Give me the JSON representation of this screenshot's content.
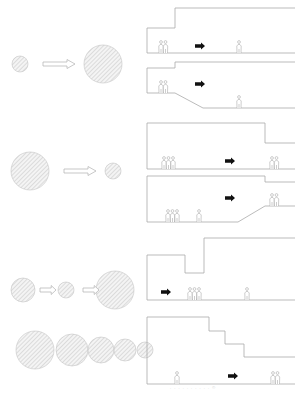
{
  "colors": {
    "line": "#aaaaaa",
    "hatch": "#bdbdbd",
    "fill": "#f2f2f2",
    "arrow": "#111111",
    "person": "#9a9a9a"
  },
  "rows": [
    {
      "id": "expansion",
      "left": {
        "circles": [
          {
            "cx": 20,
            "cy": 64,
            "r": 8
          },
          {
            "cx": 103,
            "cy": 64,
            "r": 19
          }
        ],
        "arrows": [
          {
            "x": 43,
            "y": 64,
            "w": 32
          }
        ]
      },
      "panels": [
        {
          "floor": 53,
          "shape": "M147,53 L147,28 L175,28 L175,8 L295,8",
          "floorPath": "M147,53 L295,53",
          "people": [
            {
              "x": 161,
              "n": 2
            },
            {
              "x": 239,
              "n": 1
            }
          ],
          "arrow": {
            "x": 195,
            "y": 46
          }
        },
        {
          "floor": 108,
          "shape": "M147,93 L147,68 L175,68 L175,62 L295,62",
          "floorPath": "M147,93 L175,93 L203,108 L295,108",
          "people": [
            {
              "x": 161,
              "n": 2
            },
            {
              "x": 239,
              "n": 1
            }
          ],
          "arrow": {
            "x": 195,
            "y": 84
          }
        }
      ]
    },
    {
      "id": "contraction",
      "left": {
        "circles": [
          {
            "cx": 30,
            "cy": 171,
            "r": 19
          },
          {
            "cx": 113,
            "cy": 171,
            "r": 8
          }
        ],
        "arrows": [
          {
            "x": 64,
            "y": 171,
            "w": 32
          }
        ]
      },
      "panels": [
        {
          "shape": "M147,169 L147,123 L265,123 L265,143 L295,143",
          "floorPath": "M147,169 L295,169",
          "people": [
            {
              "x": 164,
              "n": 3
            },
            {
              "x": 272,
              "n": 2
            }
          ],
          "arrow": {
            "x": 225,
            "y": 161
          }
        },
        {
          "shape": "M147,222 L147,176 L265,176 L265,182 L295,182",
          "floorPath": "M147,222 L238,222 L265,206 L295,206",
          "people": [
            {
              "x": 168,
              "n": 3
            },
            {
              "x": 199,
              "n": 1
            },
            {
              "x": 272,
              "n": 2
            }
          ],
          "arrow": {
            "x": 225,
            "y": 198
          }
        }
      ]
    },
    {
      "id": "contraction-expansion",
      "left": {
        "circles": [
          {
            "cx": 23,
            "cy": 290,
            "r": 12
          },
          {
            "cx": 66,
            "cy": 290,
            "r": 8
          },
          {
            "cx": 115,
            "cy": 290,
            "r": 19
          }
        ],
        "arrows": [
          {
            "x": 40,
            "y": 290,
            "w": 16
          },
          {
            "x": 83,
            "y": 290,
            "w": 16
          }
        ]
      },
      "panels": [
        {
          "shape": "M147,300 L147,255 L185,255 L185,273 L204,273 L204,238 L295,238",
          "floorPath": "M147,300 L295,300",
          "people": [
            {
              "x": 190,
              "n": 3
            },
            {
              "x": 247,
              "n": 1
            }
          ],
          "arrow": {
            "x": 161,
            "y": 292
          }
        }
      ]
    },
    {
      "id": "stepwise-contraction",
      "left": {
        "circles": [
          {
            "cx": 35,
            "cy": 350,
            "r": 19
          },
          {
            "cx": 72,
            "cy": 350,
            "r": 16
          },
          {
            "cx": 101,
            "cy": 350,
            "r": 13
          },
          {
            "cx": 125,
            "cy": 350,
            "r": 11
          },
          {
            "cx": 145,
            "cy": 350,
            "r": 8
          }
        ],
        "arrows": []
      },
      "panels": [
        {
          "shape": "M147,384 L147,317 L209,317 L209,331 L225,331 L225,344 L244,344 L244,357 L295,357",
          "floorPath": "M147,384 L295,384",
          "people": [
            {
              "x": 177,
              "n": 1
            },
            {
              "x": 273,
              "n": 2
            }
          ],
          "arrow": {
            "x": 228,
            "y": 376
          }
        }
      ]
    }
  ],
  "caption": ". . . . . . . . . . ©"
}
